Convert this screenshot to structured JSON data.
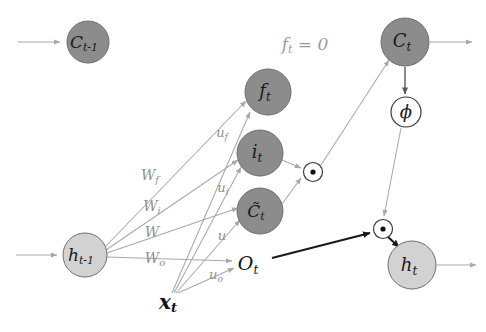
{
  "figure": {
    "background_color": "#ffffff",
    "annotation": "f t = 0"
  },
  "colors": {
    "gate_node_fill": "#8c8c8c",
    "state_node_fill": "#d2d2d2",
    "operator_node_fill": "#ffffff",
    "node_stroke": "#6e6e6e",
    "gray_edge": "#a8a8a8",
    "black_edge": "#1a1a1a",
    "weight_text": "#8f8f8f",
    "annotation_text": "#9a9a9a",
    "node_text": "#1a1a1a"
  },
  "nodes": {
    "c_prev": {
      "base": "C",
      "sub": "t-1",
      "cx": 88,
      "cy": 42,
      "r": 21
    },
    "f_gate": {
      "base": "f",
      "sub": "t",
      "cx": 268,
      "cy": 92,
      "r": 23
    },
    "i_gate": {
      "base": "i",
      "sub": "t",
      "cx": 260,
      "cy": 153,
      "r": 23
    },
    "c_tilde": {
      "base": "C̃",
      "sub": "t",
      "cx": 260,
      "cy": 211,
      "r": 23
    },
    "h_prev": {
      "base": "h",
      "sub": "t-1",
      "cx": 85,
      "cy": 255,
      "r": 22
    },
    "c_curr": {
      "base": "C",
      "sub": "t",
      "cx": 405,
      "cy": 42,
      "r": 24
    },
    "h_curr": {
      "base": "h",
      "sub": "t",
      "cx": 412,
      "cy": 265,
      "r": 24
    },
    "phi": {
      "base": "ϕ",
      "sub": "",
      "cx": 406,
      "cy": 112,
      "r": 15
    },
    "mult_1": {
      "base": "⊙",
      "sub": "",
      "cx": 313,
      "cy": 172,
      "r": 10
    },
    "mult_2": {
      "base": "⊙",
      "sub": "",
      "cx": 383,
      "cy": 229,
      "r": 10
    }
  },
  "text_labels": {
    "o_t": {
      "base": "O",
      "sub": "t",
      "x": 248,
      "y": 265
    },
    "x_t": {
      "base": "x",
      "sub": "t",
      "x": 168,
      "y": 303
    },
    "annotation": {
      "base": "f",
      "sub": "t",
      "eq": " = 0",
      "x": 305,
      "y": 45
    }
  },
  "weights": [
    {
      "name": "W_f",
      "base": "W",
      "sub": "f",
      "x": 150,
      "y": 176
    },
    {
      "name": "W_i",
      "base": "W",
      "sub": "i",
      "x": 152,
      "y": 207
    },
    {
      "name": "W",
      "base": "W",
      "sub": "",
      "x": 152,
      "y": 233
    },
    {
      "name": "W_o",
      "base": "W",
      "sub": "o",
      "x": 155,
      "y": 259
    },
    {
      "name": "u_f",
      "base": "u",
      "sub": "f",
      "x": 222,
      "y": 133
    },
    {
      "name": "u_i",
      "base": "u",
      "sub": "i",
      "x": 223,
      "y": 188
    },
    {
      "name": "u",
      "base": "u",
      "sub": "",
      "x": 222,
      "y": 236
    },
    {
      "name": "u_o",
      "base": "u",
      "sub": "o",
      "x": 216,
      "y": 275
    }
  ],
  "edges": [
    {
      "name": "input-to-c-prev",
      "style": "gray",
      "arrow": true
    },
    {
      "name": "input-to-h-prev",
      "style": "gray",
      "arrow": true
    },
    {
      "name": "h-prev-to-f-gate",
      "style": "gray",
      "arrow": true
    },
    {
      "name": "h-prev-to-i-gate",
      "style": "gray",
      "arrow": true
    },
    {
      "name": "h-prev-to-c-tilde",
      "style": "gray",
      "arrow": true
    },
    {
      "name": "h-prev-to-o-t",
      "style": "gray",
      "arrow": true
    },
    {
      "name": "x-t-to-f-gate",
      "style": "gray",
      "arrow": true
    },
    {
      "name": "x-t-to-i-gate",
      "style": "gray",
      "arrow": true
    },
    {
      "name": "x-t-to-c-tilde",
      "style": "gray",
      "arrow": true
    },
    {
      "name": "x-t-to-o-t",
      "style": "gray",
      "arrow": true
    },
    {
      "name": "i-gate-to-mult-1",
      "style": "gray",
      "arrow": true
    },
    {
      "name": "c-tilde-to-mult-1",
      "style": "gray",
      "arrow": true
    },
    {
      "name": "mult-1-to-c-curr",
      "style": "gray",
      "arrow": true
    },
    {
      "name": "c-curr-to-phi",
      "style": "dark",
      "arrow": true
    },
    {
      "name": "c-curr-output",
      "style": "gray",
      "arrow": true
    },
    {
      "name": "phi-to-mult-2",
      "style": "gray",
      "arrow": true
    },
    {
      "name": "o-t-to-mult-2",
      "style": "black",
      "arrow": true
    },
    {
      "name": "mult-2-to-h-curr",
      "style": "black",
      "arrow": true
    },
    {
      "name": "h-curr-output",
      "style": "gray",
      "arrow": true
    }
  ]
}
